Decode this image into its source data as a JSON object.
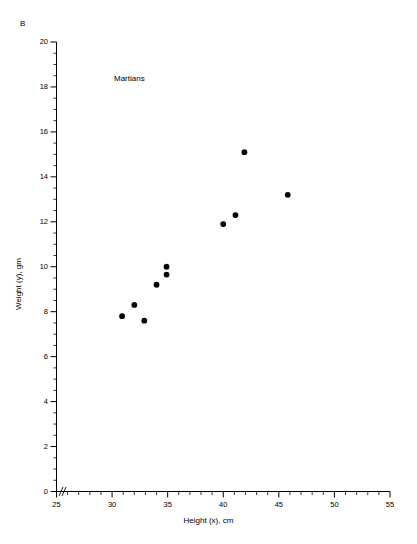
{
  "figure": {
    "panel_label": "B",
    "series_label": "Martians",
    "x_axis_title": "Height (x), cm",
    "y_axis_title": "Weight (y), gm",
    "marker_color": "#000000",
    "axis_color": "#000000",
    "background_color": "#ffffff"
  },
  "chart_data": {
    "type": "scatter",
    "title": "",
    "subtitle": "",
    "xlabel": "Height (x), cm",
    "ylabel": "Weight (y), gm",
    "xlim": [
      25,
      55
    ],
    "ylim": [
      0,
      20
    ],
    "xticks": [
      25,
      30,
      35,
      40,
      45,
      50,
      55
    ],
    "yticks": [
      0,
      2,
      4,
      6,
      8,
      10,
      12,
      14,
      16,
      18,
      20
    ],
    "x_minor_tick_step": 1,
    "y_minor_tick_step": 0.5,
    "grid": false,
    "legend": "none",
    "annotations": [
      "B",
      "Martians"
    ],
    "axis_break": "x-axis break between origin and 25",
    "series": [
      {
        "name": "Martians",
        "marker": "filled-circle",
        "color": "#000000",
        "x": [
          30.9,
          32.0,
          32.9,
          34.0,
          34.9,
          34.9,
          40.0,
          41.1,
          41.9,
          45.8
        ],
        "y": [
          7.8,
          8.3,
          7.6,
          9.2,
          10.0,
          9.65,
          11.9,
          12.3,
          15.1,
          13.2
        ]
      }
    ]
  },
  "xtick_labels": [
    "25",
    "30",
    "35",
    "40",
    "45",
    "50",
    "55"
  ],
  "ytick_labels": [
    "0",
    "2",
    "4",
    "6",
    "8",
    "10",
    "12",
    "14",
    "16",
    "18",
    "20"
  ]
}
